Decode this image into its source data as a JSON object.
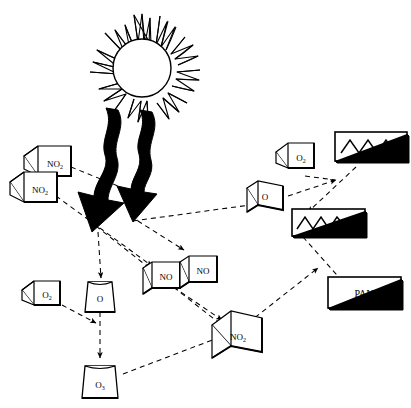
{
  "diagram": {
    "background_color": "#ffffff",
    "line_color": "#000000",
    "dashed_color": "#000000",
    "sunlight_arrow_color": "#000000",
    "nodes": [
      {
        "id": "sun",
        "label": "",
        "sub": "",
        "shape": "sun",
        "x": 134,
        "y": 62,
        "w": 96,
        "h": 100
      },
      {
        "id": "no2-a",
        "label": "NO",
        "sub": "2",
        "shape": "cube",
        "x": 46,
        "y": 154,
        "w": 46,
        "h": 34
      },
      {
        "id": "no2-b",
        "label": "NO",
        "sub": "2",
        "shape": "cube",
        "x": 31,
        "y": 179,
        "w": 46,
        "h": 34
      },
      {
        "id": "o-flask",
        "label": "O",
        "sub": "",
        "shape": "flask",
        "x": 90,
        "y": 290,
        "w": 26,
        "h": 26
      },
      {
        "id": "o2-left",
        "label": "O",
        "sub": "2",
        "shape": "cube",
        "x": 37,
        "y": 291,
        "w": 34,
        "h": 28
      },
      {
        "id": "o3",
        "label": "O",
        "sub": "3",
        "shape": "flask",
        "x": 92,
        "y": 380,
        "w": 28,
        "h": 28
      },
      {
        "id": "no-a",
        "label": "NO",
        "sub": "",
        "shape": "slab",
        "x": 155,
        "y": 262,
        "w": 30,
        "h": 28
      },
      {
        "id": "no-b",
        "label": "NO",
        "sub": "",
        "shape": "slab",
        "x": 192,
        "y": 258,
        "w": 30,
        "h": 28
      },
      {
        "id": "no2-c",
        "label": "NO",
        "sub": "2",
        "shape": "cube",
        "x": 235,
        "y": 328,
        "w": 40,
        "h": 34
      },
      {
        "id": "o-slab",
        "label": "O",
        "sub": "",
        "shape": "slab",
        "x": 257,
        "y": 192,
        "w": 28,
        "h": 30
      },
      {
        "id": "o2-right",
        "label": "O",
        "sub": "2",
        "shape": "cube",
        "x": 294,
        "y": 153,
        "w": 34,
        "h": 28
      },
      {
        "id": "ch-box",
        "label": "CH",
        "sub": "",
        "shape": "wave-box",
        "x": 371,
        "y": 146,
        "w": 72,
        "h": 28
      },
      {
        "id": "co-box",
        "label": "CO",
        "sub": "",
        "shape": "wave-box",
        "x": 330,
        "y": 222,
        "w": 68,
        "h": 26
      },
      {
        "id": "pan-box",
        "label": "PAN",
        "sub": "",
        "shape": "plain-box",
        "x": 364,
        "y": 292,
        "w": 72,
        "h": 30
      }
    ],
    "sunlight_arrows": [
      {
        "id": "sunbeam-left",
        "label": "sunlight"
      },
      {
        "id": "sunbeam-right",
        "label": "sunlight"
      }
    ],
    "edges": [
      {
        "from": "no2-a",
        "to": "sunbeam-left",
        "style": "dashed"
      },
      {
        "from": "no2-b",
        "to": "no-a",
        "style": "dashed"
      },
      {
        "from": "sunbeam",
        "to": "o-flask",
        "style": "dashed"
      },
      {
        "from": "sunbeam",
        "to": "no2-c",
        "style": "dashed"
      },
      {
        "from": "o2-left",
        "to": "o-flask",
        "style": "dashed"
      },
      {
        "from": "o-flask",
        "to": "o3",
        "style": "dashed"
      },
      {
        "from": "o3",
        "to": "no2-c",
        "style": "dashed"
      },
      {
        "from": "o-slab",
        "to": "ch-box",
        "style": "dashed"
      },
      {
        "from": "o2-right",
        "to": "ch-box",
        "style": "dashed"
      },
      {
        "from": "ch-box",
        "to": "co-box",
        "style": "dashed"
      },
      {
        "from": "co-box",
        "to": "pan-box",
        "style": "dashed"
      },
      {
        "from": "no2-c",
        "to": "pan-box",
        "style": "dashed"
      },
      {
        "from": "no-a",
        "to": "no2-c",
        "style": "dashed"
      },
      {
        "from": "sunbeam",
        "to": "o-slab",
        "style": "dashed"
      }
    ]
  }
}
